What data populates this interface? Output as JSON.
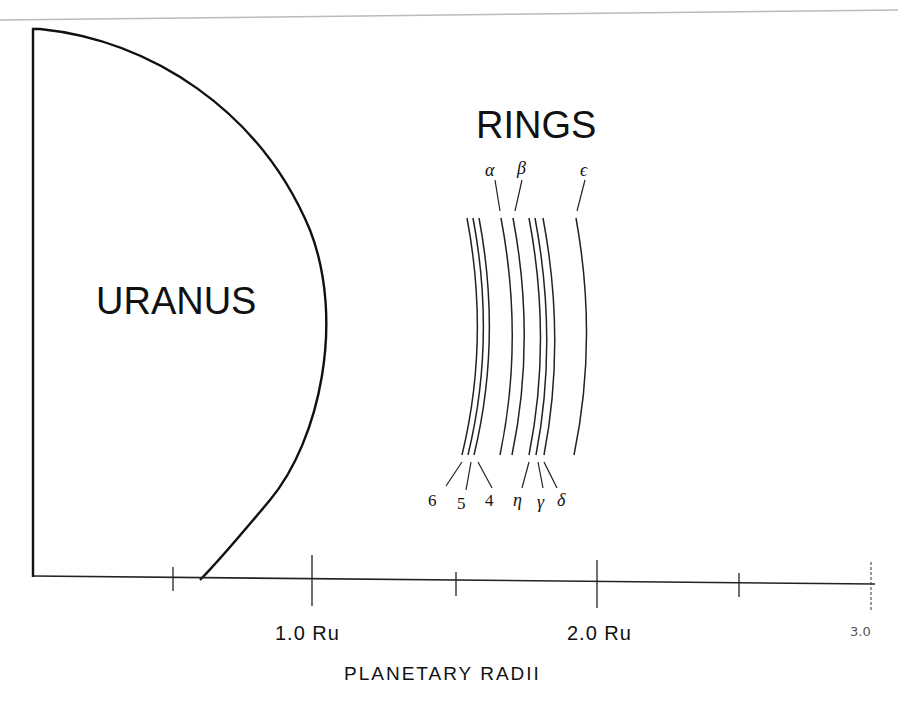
{
  "diagram": {
    "planet_label": "URANUS",
    "rings_label": "RINGS",
    "rings_top": [
      {
        "name": "alpha",
        "symbol": "α"
      },
      {
        "name": "beta",
        "symbol": "β"
      },
      {
        "name": "epsilon",
        "symbol": "ϵ"
      }
    ],
    "rings_bottom": [
      {
        "name": "6",
        "symbol": "6"
      },
      {
        "name": "5",
        "symbol": "5"
      },
      {
        "name": "4",
        "symbol": "4"
      },
      {
        "name": "eta",
        "symbol": "η"
      },
      {
        "name": "gamma",
        "symbol": "γ"
      },
      {
        "name": "delta",
        "symbol": "δ"
      }
    ],
    "axis": {
      "title": "PLANETARY RADII",
      "ticks": [
        {
          "value": 1.0,
          "label": "1.0 Ru"
        },
        {
          "value": 2.0,
          "label": "2.0 Ru"
        },
        {
          "value": 3.0,
          "label": "3.0"
        }
      ]
    }
  }
}
